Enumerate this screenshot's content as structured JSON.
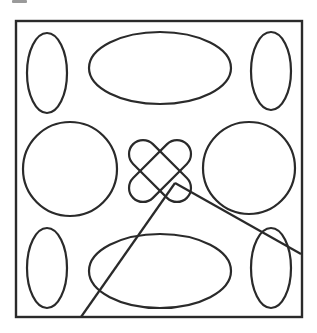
{
  "figure": {
    "stroke_color": "#2a2a2a",
    "background": "#ffffff",
    "frame": {
      "x": 16,
      "y": 21,
      "width": 286,
      "height": 296
    },
    "ellipses": [
      {
        "name": "top-left-ellipse",
        "cx": 47,
        "cy": 73,
        "rx": 20,
        "ry": 40
      },
      {
        "name": "top-middle-ellipse",
        "cx": 160,
        "cy": 68,
        "rx": 71,
        "ry": 36
      },
      {
        "name": "top-right-ellipse",
        "cx": 271,
        "cy": 71,
        "rx": 20,
        "ry": 39
      },
      {
        "name": "left-circle",
        "cx": 70,
        "cy": 169,
        "rx": 47,
        "ry": 47
      },
      {
        "name": "right-circle",
        "cx": 249,
        "cy": 168,
        "rx": 46,
        "ry": 46
      },
      {
        "name": "bottom-left-ellipse",
        "cx": 47,
        "cy": 268,
        "rx": 20,
        "ry": 40
      },
      {
        "name": "bottom-middle-ellipse",
        "cx": 160,
        "cy": 271,
        "rx": 71,
        "ry": 37
      },
      {
        "name": "bottom-right-ellipse",
        "cx": 271,
        "cy": 268,
        "rx": 20,
        "ry": 40
      }
    ],
    "center_cross": {
      "cx": 160,
      "cy": 171,
      "length": 76,
      "thickness": 28,
      "angles": [
        45,
        -45
      ]
    },
    "angle_lines": {
      "vertex": {
        "x": 175,
        "y": 183
      },
      "ray1_end": {
        "x": 81,
        "y": 317
      },
      "ray2_end": {
        "x": 301,
        "y": 254
      }
    }
  }
}
